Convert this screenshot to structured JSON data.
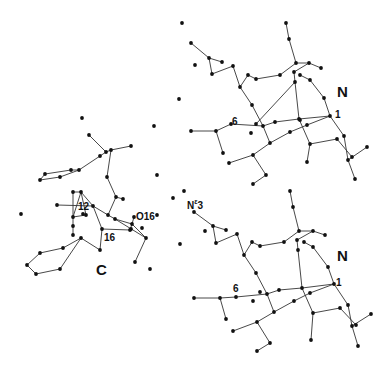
{
  "figure": {
    "width": 390,
    "height": 368,
    "colors": {
      "bond": "#333333",
      "atom": "#111111",
      "label": "#111111",
      "background": "#ffffff"
    },
    "labels": [
      {
        "id": "label-n-top",
        "text": "N",
        "x": 337,
        "y": 97,
        "size": "big"
      },
      {
        "id": "label-1-top",
        "text": "1",
        "x": 335,
        "y": 118,
        "size": "small"
      },
      {
        "id": "label-6-top",
        "text": "6",
        "x": 232,
        "y": 125,
        "size": "small"
      },
      {
        "id": "label-n-bottom",
        "text": "N",
        "x": 337,
        "y": 261,
        "size": "big"
      },
      {
        "id": "label-1-bottom",
        "text": "1",
        "x": 336,
        "y": 286,
        "size": "small"
      },
      {
        "id": "label-6-bottom",
        "text": "6",
        "x": 233,
        "y": 292,
        "size": "small"
      },
      {
        "id": "label-ne3",
        "text": "N",
        "sup": "ε",
        "tail": "3",
        "x": 187,
        "y": 209,
        "size": "small"
      },
      {
        "id": "label-c",
        "text": "C",
        "x": 96,
        "y": 275,
        "size": "big"
      },
      {
        "id": "label-12",
        "text": "12",
        "x": 78,
        "y": 210,
        "size": "small"
      },
      {
        "id": "label-16",
        "text": "16",
        "x": 104,
        "y": 241,
        "size": "small"
      },
      {
        "id": "label-o16",
        "text": "O16",
        "x": 136,
        "y": 220,
        "size": "small"
      }
    ],
    "isolated_atoms": [
      [
        182,
        23
      ],
      [
        179,
        99
      ],
      [
        154,
        126
      ],
      [
        195,
        65
      ],
      [
        21,
        214
      ],
      [
        157,
        215
      ],
      [
        150,
        269
      ],
      [
        180,
        244
      ],
      [
        184,
        191
      ],
      [
        173,
        198
      ],
      [
        157,
        175
      ],
      [
        205,
        231
      ]
    ],
    "molecules": [
      {
        "name": "N-top",
        "atoms": [
          [
            191,
            43
          ],
          [
            209,
            58
          ],
          [
            222,
            62
          ],
          [
            212,
            74
          ],
          [
            233,
            66
          ],
          [
            240,
            87
          ],
          [
            248,
            75
          ],
          [
            256,
            79
          ],
          [
            280,
            75
          ],
          [
            296,
            63
          ],
          [
            286,
            23
          ],
          [
            289,
            39
          ],
          [
            309,
            63
          ],
          [
            321,
            68
          ],
          [
            294,
            72
          ],
          [
            295,
            82
          ],
          [
            300,
            75
          ],
          [
            310,
            80
          ],
          [
            324,
            98
          ],
          [
            330,
            116
          ],
          [
            252,
            105
          ],
          [
            256,
            124
          ],
          [
            263,
            126
          ],
          [
            275,
            122
          ],
          [
            299,
            119
          ],
          [
            307,
            125
          ],
          [
            290,
            132
          ],
          [
            270,
            143
          ],
          [
            253,
            155
          ],
          [
            229,
            163
          ],
          [
            266,
            175
          ],
          [
            253,
            184
          ],
          [
            231,
            124
          ],
          [
            216,
            131
          ],
          [
            223,
            153
          ],
          [
            191,
            131
          ],
          [
            310,
            144
          ],
          [
            337,
            139
          ],
          [
            344,
            136
          ],
          [
            352,
            157
          ],
          [
            348,
            160
          ],
          [
            367,
            147
          ],
          [
            355,
            179
          ],
          [
            307,
            162
          ],
          [
            300,
            120
          ],
          [
            251,
            133
          ]
        ],
        "bonds": [
          [
            0,
            1
          ],
          [
            1,
            2
          ],
          [
            1,
            3
          ],
          [
            3,
            4
          ],
          [
            4,
            5
          ],
          [
            5,
            6
          ],
          [
            6,
            7
          ],
          [
            7,
            8
          ],
          [
            8,
            9
          ],
          [
            10,
            11
          ],
          [
            11,
            9
          ],
          [
            9,
            12
          ],
          [
            12,
            13
          ],
          [
            12,
            14
          ],
          [
            14,
            15
          ],
          [
            15,
            21
          ],
          [
            16,
            17
          ],
          [
            17,
            18
          ],
          [
            18,
            19
          ],
          [
            5,
            20
          ],
          [
            20,
            22
          ],
          [
            22,
            23
          ],
          [
            23,
            24
          ],
          [
            24,
            19
          ],
          [
            22,
            27
          ],
          [
            27,
            26
          ],
          [
            26,
            25
          ],
          [
            25,
            19
          ],
          [
            27,
            28
          ],
          [
            28,
            29
          ],
          [
            28,
            30
          ],
          [
            30,
            31
          ],
          [
            35,
            33
          ],
          [
            33,
            32
          ],
          [
            32,
            22
          ],
          [
            33,
            34
          ],
          [
            24,
            36
          ],
          [
            36,
            37
          ],
          [
            37,
            39
          ],
          [
            19,
            38
          ],
          [
            38,
            40
          ],
          [
            40,
            41
          ],
          [
            40,
            42
          ],
          [
            36,
            43
          ],
          [
            24,
            15
          ]
        ]
      },
      {
        "name": "N-bottom",
        "atoms": [
          [
            194,
            212
          ],
          [
            213,
            226
          ],
          [
            226,
            230
          ],
          [
            216,
            243
          ],
          [
            237,
            234
          ],
          [
            244,
            255
          ],
          [
            252,
            242
          ],
          [
            260,
            246
          ],
          [
            284,
            242
          ],
          [
            299,
            231
          ],
          [
            290,
            191
          ],
          [
            293,
            207
          ],
          [
            313,
            231
          ],
          [
            325,
            235
          ],
          [
            297,
            240
          ],
          [
            298,
            250
          ],
          [
            304,
            242
          ],
          [
            313,
            247
          ],
          [
            328,
            267
          ],
          [
            334,
            284
          ],
          [
            256,
            273
          ],
          [
            260,
            292
          ],
          [
            267,
            294
          ],
          [
            279,
            290
          ],
          [
            302,
            288
          ],
          [
            310,
            293
          ],
          [
            294,
            301
          ],
          [
            274,
            312
          ],
          [
            257,
            322
          ],
          [
            233,
            331
          ],
          [
            270,
            343
          ],
          [
            257,
            351
          ],
          [
            236,
            297
          ],
          [
            220,
            298
          ],
          [
            226,
            319
          ],
          [
            194,
            298
          ],
          [
            313,
            313
          ],
          [
            340,
            308
          ],
          [
            348,
            305
          ],
          [
            356,
            325
          ],
          [
            352,
            326
          ],
          [
            371,
            314
          ],
          [
            358,
            346
          ],
          [
            311,
            340
          ],
          [
            253,
            301
          ]
        ],
        "bonds": [
          [
            0,
            1
          ],
          [
            1,
            2
          ],
          [
            1,
            3
          ],
          [
            3,
            4
          ],
          [
            4,
            5
          ],
          [
            5,
            6
          ],
          [
            6,
            7
          ],
          [
            7,
            8
          ],
          [
            8,
            9
          ],
          [
            10,
            11
          ],
          [
            11,
            9
          ],
          [
            9,
            12
          ],
          [
            12,
            13
          ],
          [
            12,
            14
          ],
          [
            14,
            15
          ],
          [
            15,
            24
          ],
          [
            16,
            17
          ],
          [
            17,
            18
          ],
          [
            18,
            19
          ],
          [
            5,
            20
          ],
          [
            20,
            22
          ],
          [
            22,
            23
          ],
          [
            23,
            24
          ],
          [
            24,
            19
          ],
          [
            22,
            27
          ],
          [
            27,
            26
          ],
          [
            26,
            25
          ],
          [
            25,
            19
          ],
          [
            27,
            28
          ],
          [
            28,
            29
          ],
          [
            28,
            30
          ],
          [
            30,
            31
          ],
          [
            35,
            33
          ],
          [
            33,
            32
          ],
          [
            32,
            22
          ],
          [
            33,
            34
          ],
          [
            24,
            36
          ],
          [
            36,
            37
          ],
          [
            37,
            39
          ],
          [
            19,
            38
          ],
          [
            38,
            40
          ],
          [
            40,
            41
          ],
          [
            40,
            42
          ],
          [
            36,
            43
          ]
        ]
      },
      {
        "name": "C",
        "atoms": [
          [
            89,
            135
          ],
          [
            106,
            152
          ],
          [
            111,
            150
          ],
          [
            131,
            146
          ],
          [
            100,
            156
          ],
          [
            79,
            170
          ],
          [
            71,
            170
          ],
          [
            45,
            174
          ],
          [
            40,
            180
          ],
          [
            60,
            177
          ],
          [
            107,
            177
          ],
          [
            116,
            197
          ],
          [
            123,
            199
          ],
          [
            73,
            192
          ],
          [
            81,
            192
          ],
          [
            57,
            205
          ],
          [
            83,
            214
          ],
          [
            73,
            217
          ],
          [
            86,
            215
          ],
          [
            93,
            206
          ],
          [
            108,
            215
          ],
          [
            115,
            219
          ],
          [
            132,
            224
          ],
          [
            134,
            217
          ],
          [
            131,
            229
          ],
          [
            142,
            228
          ],
          [
            146,
            238
          ],
          [
            135,
            262
          ],
          [
            102,
            229
          ],
          [
            130,
            230
          ],
          [
            100,
            250
          ],
          [
            81,
            238
          ],
          [
            73,
            226
          ],
          [
            63,
            248
          ],
          [
            40,
            253
          ],
          [
            27,
            265
          ],
          [
            36,
            274
          ],
          [
            60,
            269
          ],
          [
            82,
            118
          ],
          [
            73,
            235
          ]
        ],
        "bonds": [
          [
            0,
            1
          ],
          [
            1,
            2
          ],
          [
            2,
            3
          ],
          [
            1,
            4
          ],
          [
            4,
            5
          ],
          [
            5,
            6
          ],
          [
            6,
            7
          ],
          [
            7,
            8
          ],
          [
            8,
            9
          ],
          [
            9,
            5
          ],
          [
            2,
            10
          ],
          [
            10,
            11
          ],
          [
            11,
            12
          ],
          [
            11,
            20
          ],
          [
            6,
            71
          ],
          [
            15,
            19
          ],
          [
            19,
            20
          ],
          [
            20,
            21
          ],
          [
            21,
            22
          ],
          [
            22,
            26
          ],
          [
            26,
            27
          ],
          [
            17,
            18
          ],
          [
            18,
            14
          ],
          [
            14,
            13
          ],
          [
            13,
            32
          ],
          [
            32,
            39
          ],
          [
            14,
            19
          ],
          [
            21,
            26
          ],
          [
            19,
            28
          ],
          [
            28,
            29
          ],
          [
            29,
            22
          ],
          [
            28,
            30
          ],
          [
            30,
            31
          ],
          [
            31,
            33
          ],
          [
            33,
            34
          ],
          [
            34,
            35
          ],
          [
            35,
            36
          ],
          [
            36,
            37
          ],
          [
            37,
            31
          ],
          [
            22,
            23
          ],
          [
            17,
            14
          ]
        ]
      }
    ]
  }
}
